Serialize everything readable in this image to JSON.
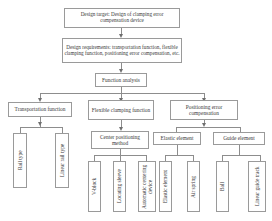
{
  "diagram": {
    "title_node": {
      "id": "design-target",
      "text": "Design target: Design of clamping error compensation device"
    },
    "requirements_node": {
      "id": "design-requirements",
      "text": "Design requirements: transportation function, flexible clamping function, positioning error compensation, etc."
    },
    "function_analysis_node": {
      "id": "function-analysis",
      "text": "Function analysis"
    },
    "level3": [
      {
        "id": "transportation-function",
        "text": "Transportation function"
      },
      {
        "id": "flexible-clamping-function",
        "text": "Flexible clamping function"
      },
      {
        "id": "positioning-error-compensation",
        "text": "Positioning error compensation"
      }
    ],
    "level4": [
      {
        "id": "center-positioning-method",
        "text": "Center positioning method"
      },
      {
        "id": "elastic-element",
        "text": "Elastic element"
      },
      {
        "id": "guide-element",
        "text": "Guide element"
      }
    ],
    "level5": [
      {
        "id": "rail-type",
        "text": "Rail type"
      },
      {
        "id": "linear-rail-type",
        "text": "Linear rail type"
      },
      {
        "id": "v-block",
        "text": "V-block"
      },
      {
        "id": "locating-sleeve",
        "text": "Locating sleeve"
      },
      {
        "id": "automatic-centering-device",
        "text": "Automatic centering device"
      },
      {
        "id": "elastic-element-leaf",
        "text": "Elastic element"
      },
      {
        "id": "air-spring",
        "text": "Air spring"
      },
      {
        "id": "ball",
        "text": "Ball"
      },
      {
        "id": "linear-guide-track",
        "text": "Linear guide track"
      }
    ],
    "colors": {
      "border": "#9a9a9a",
      "text": "#3a3a3a",
      "connector": "#8d8d8d",
      "background": "#ffffff"
    }
  }
}
